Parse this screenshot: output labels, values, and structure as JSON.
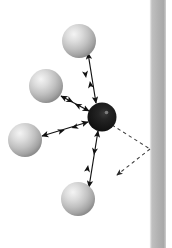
{
  "figure": {
    "name": "particle-wall-interaction-diagram",
    "title": "Central particle interacting with neighbouring particles near a wall",
    "width": 172,
    "height": 248,
    "background_color": "#ffffff"
  },
  "colors": {
    "background": "#ffffff",
    "wall_fill": "#b0b0b0",
    "wall_edge_light": "#d8d8d8",
    "wall_edge_dark": "#9a9a9a",
    "sphere_light_highlight": "#f2f2f2",
    "sphere_light_mid": "#c2c2c2",
    "sphere_light_edge": "#8e8e8e",
    "sphere_dark_highlight": "#4a4a4a",
    "sphere_dark_mid": "#222222",
    "sphere_dark_edge": "#0c0c0c",
    "arrow_solid": "#111111",
    "arrow_dashed": "#4d4d4d"
  },
  "wall": {
    "label": "wall",
    "x": 150,
    "y": 0,
    "width": 16,
    "height": 248,
    "orientation": "vertical"
  },
  "particles": {
    "center": {
      "label": "central dark particle",
      "cx": 102,
      "cy": 117,
      "r": 14.5,
      "shade": "dark"
    },
    "neighbors": [
      {
        "label": "upper particle",
        "cx": 79,
        "cy": 41,
        "r": 17,
        "shade": "light"
      },
      {
        "label": "upper-left particle",
        "cx": 46,
        "cy": 86,
        "r": 17,
        "shade": "light"
      },
      {
        "label": "left particle",
        "cx": 25,
        "cy": 140,
        "r": 17,
        "shade": "light"
      },
      {
        "label": "lower particle",
        "cx": 78,
        "cy": 199,
        "r": 17,
        "shade": "light"
      }
    ]
  },
  "interaction_arrows": [
    {
      "label": "double arrow to upper particle",
      "style": "solid",
      "double_headed": true,
      "x1": 88,
      "y1": 53,
      "x2": 96,
      "y2": 103
    },
    {
      "label": "double arrow to upper-left particle",
      "style": "solid",
      "double_headed": true,
      "x1": 61,
      "y1": 96,
      "x2": 89,
      "y2": 111
    },
    {
      "label": "double arrow to left particle",
      "style": "solid",
      "double_headed": true,
      "x1": 42,
      "y1": 136,
      "x2": 88,
      "y2": 122
    },
    {
      "label": "double arrow to lower particle",
      "style": "solid",
      "double_headed": true,
      "x1": 89,
      "y1": 187,
      "x2": 98,
      "y2": 131
    }
  ],
  "wall_reflection_path": {
    "label": "dashed reflection path off the wall",
    "style": "dashed",
    "incident": {
      "x1": 112,
      "y1": 125,
      "x2": 150,
      "y2": 149
    },
    "reflected": {
      "x1": 150,
      "y1": 149,
      "x2": 114,
      "y2": 177
    },
    "arrowhead_at": "reflected-end"
  }
}
